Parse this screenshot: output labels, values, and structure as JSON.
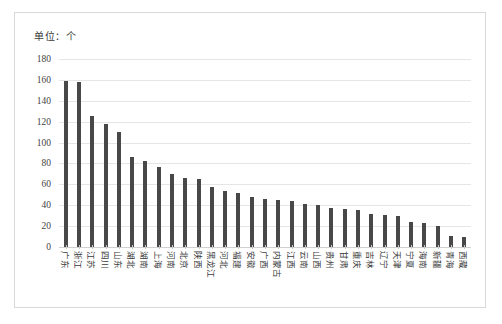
{
  "caption": {
    "unit_label": "单位：个"
  },
  "chart_data": {
    "type": "bar",
    "title": "",
    "subtitle": "",
    "xlabel": "",
    "ylabel": "",
    "unit": "个",
    "unit_note": "单位：个",
    "ylim": [
      0,
      180
    ],
    "ytick_step": 20,
    "yticks": [
      0,
      20,
      40,
      60,
      80,
      100,
      120,
      140,
      160,
      180
    ],
    "ytick_labels": [
      "0",
      "20",
      "40",
      "60",
      "80",
      "100",
      "120",
      "140",
      "160",
      "180"
    ],
    "grid": true,
    "grid_axis": "y",
    "legend": false,
    "legend_position": "none",
    "bar_color": "#484848",
    "categories": [
      "广东",
      "浙江",
      "江苏",
      "四川",
      "山东",
      "湖北",
      "湖南",
      "上海",
      "河南",
      "北京",
      "陕西",
      "黑龙江",
      "河北",
      "福建",
      "安徽",
      "广西",
      "内蒙古",
      "江西",
      "云南",
      "山西",
      "贵州",
      "甘肃",
      "重庆",
      "吉林",
      "辽宁",
      "天津",
      "宁夏",
      "海南",
      "新疆",
      "青海",
      "西藏"
    ],
    "values": [
      159,
      158,
      125,
      118,
      110,
      86,
      82,
      77,
      70,
      66,
      65,
      57,
      54,
      52,
      48,
      46,
      45,
      44,
      41,
      40,
      37,
      36,
      35,
      32,
      31,
      30,
      24,
      23,
      20,
      11,
      10
    ],
    "xtick_rotation": 90
  }
}
